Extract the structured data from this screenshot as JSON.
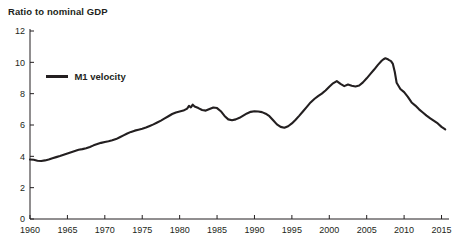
{
  "chart_data": {
    "type": "line",
    "title": "Ratio to nominal GDP",
    "xlabel": "",
    "ylabel": "",
    "grid": false,
    "legend_position": "inside-top-left",
    "xlim": [
      1960,
      2016
    ],
    "ylim": [
      0,
      12
    ],
    "xticks": [
      1960,
      1965,
      1970,
      1975,
      1980,
      1985,
      1990,
      1995,
      2000,
      2005,
      2010,
      2015
    ],
    "yticks": [
      0,
      2,
      4,
      6,
      8,
      10,
      12
    ],
    "xtick_labels": [
      "1960",
      "1965",
      "1970",
      "1975",
      "1980",
      "1985",
      "1990",
      "1995",
      "2000",
      "2005",
      "2010",
      "2015"
    ],
    "ytick_labels": [
      "0",
      "2",
      "4",
      "6",
      "8",
      "10",
      "12"
    ],
    "series": [
      {
        "name": "M1 velocity",
        "color": "#231f20",
        "x": [
          1960.0,
          1960.5,
          1961.0,
          1961.5,
          1962.0,
          1962.5,
          1963.0,
          1963.5,
          1964.0,
          1964.5,
          1965.0,
          1965.5,
          1966.0,
          1966.5,
          1967.0,
          1967.5,
          1968.0,
          1968.5,
          1969.0,
          1969.5,
          1970.0,
          1970.5,
          1971.0,
          1971.5,
          1972.0,
          1972.5,
          1973.0,
          1973.5,
          1974.0,
          1974.5,
          1975.0,
          1975.5,
          1976.0,
          1976.5,
          1977.0,
          1977.5,
          1978.0,
          1978.5,
          1979.0,
          1979.5,
          1980.0,
          1980.5,
          1981.0,
          1981.25,
          1981.5,
          1981.75,
          1982.0,
          1982.5,
          1983.0,
          1983.5,
          1984.0,
          1984.5,
          1985.0,
          1985.5,
          1986.0,
          1986.5,
          1987.0,
          1987.5,
          1988.0,
          1988.5,
          1989.0,
          1989.5,
          1990.0,
          1990.5,
          1991.0,
          1991.5,
          1992.0,
          1992.5,
          1993.0,
          1993.5,
          1994.0,
          1994.5,
          1995.0,
          1995.5,
          1996.0,
          1996.5,
          1997.0,
          1997.5,
          1998.0,
          1998.5,
          1999.0,
          1999.5,
          2000.0,
          2000.5,
          2001.0,
          2001.5,
          2002.0,
          2002.5,
          2003.0,
          2003.5,
          2004.0,
          2004.5,
          2005.0,
          2005.5,
          2006.0,
          2006.5,
          2007.0,
          2007.25,
          2007.5,
          2007.75,
          2008.0,
          2008.25,
          2008.5,
          2008.75,
          2009.0,
          2009.5,
          2010.0,
          2010.5,
          2011.0,
          2011.5,
          2012.0,
          2012.5,
          2013.0,
          2013.5,
          2014.0,
          2014.5,
          2015.0,
          2015.5
        ],
        "y": [
          3.8,
          3.78,
          3.72,
          3.7,
          3.74,
          3.8,
          3.88,
          3.95,
          4.02,
          4.1,
          4.18,
          4.26,
          4.34,
          4.42,
          4.46,
          4.52,
          4.6,
          4.7,
          4.78,
          4.86,
          4.92,
          4.96,
          5.02,
          5.1,
          5.22,
          5.34,
          5.46,
          5.56,
          5.64,
          5.7,
          5.76,
          5.84,
          5.94,
          6.04,
          6.16,
          6.28,
          6.42,
          6.56,
          6.7,
          6.8,
          6.86,
          6.92,
          7.05,
          7.22,
          7.12,
          7.3,
          7.18,
          7.08,
          6.96,
          6.92,
          7.02,
          7.12,
          7.08,
          6.88,
          6.58,
          6.36,
          6.3,
          6.36,
          6.46,
          6.6,
          6.74,
          6.84,
          6.88,
          6.86,
          6.82,
          6.72,
          6.56,
          6.3,
          6.04,
          5.88,
          5.82,
          5.92,
          6.1,
          6.34,
          6.6,
          6.88,
          7.16,
          7.44,
          7.66,
          7.84,
          8.0,
          8.2,
          8.44,
          8.66,
          8.8,
          8.62,
          8.48,
          8.58,
          8.5,
          8.46,
          8.52,
          8.72,
          8.98,
          9.26,
          9.54,
          9.84,
          10.1,
          10.2,
          10.26,
          10.22,
          10.14,
          10.08,
          9.9,
          9.4,
          8.7,
          8.3,
          8.1,
          7.8,
          7.44,
          7.24,
          7.0,
          6.8,
          6.6,
          6.42,
          6.26,
          6.1,
          5.88,
          5.72
        ]
      }
    ]
  },
  "legend": {
    "label": "M1 velocity"
  }
}
